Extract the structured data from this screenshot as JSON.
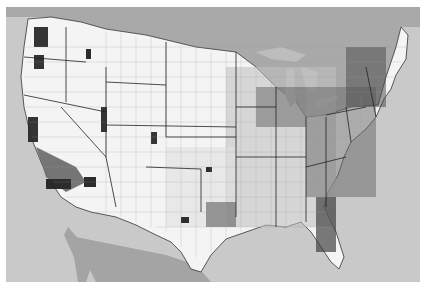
{
  "map": {
    "type": "choropleth",
    "region": "Contiguous United States",
    "unit": "county",
    "color_scheme": "grayscale",
    "colors": {
      "ocean": "#c9c9c9",
      "neighbor_land": "#a9a9a9",
      "great_lakes": "#bdbdbd",
      "class_0": "#ffffff",
      "class_1": "#d4d4d4",
      "class_2": "#8e8e8e",
      "class_3": "#1e1e1e",
      "border": "#333333"
    },
    "legend": null,
    "title": null
  }
}
